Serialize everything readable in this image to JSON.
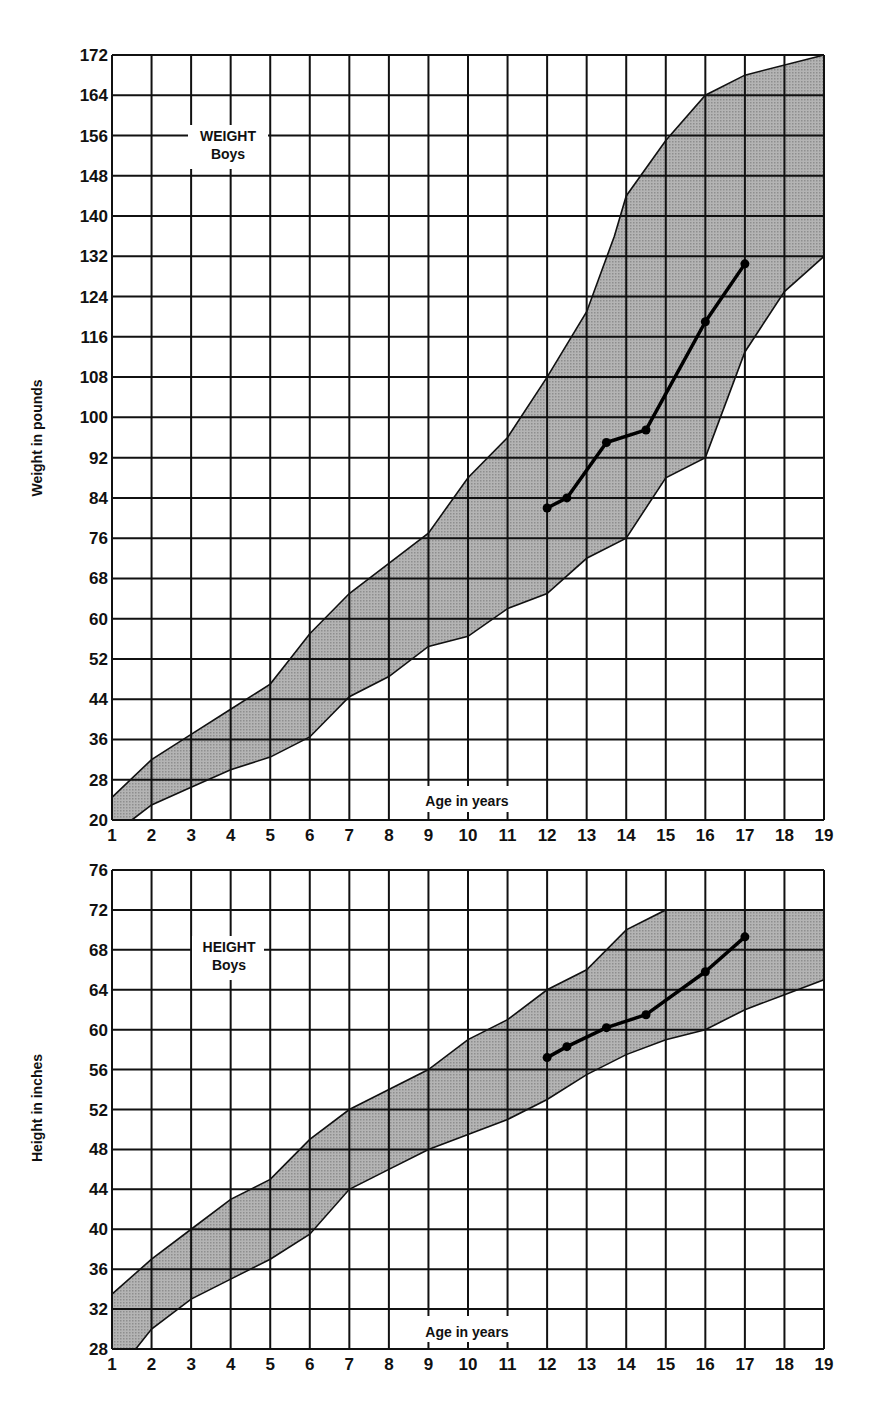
{
  "chart_data": [
    {
      "type": "area",
      "title": "WEIGHT",
      "subtitle": "Boys",
      "xlabel": "Age in years",
      "ylabel": "Weight in pounds",
      "xlim": [
        1,
        19
      ],
      "ylim": [
        20,
        172
      ],
      "grid": true,
      "x_ticks": [
        1,
        2,
        3,
        4,
        5,
        6,
        7,
        8,
        9,
        10,
        11,
        12,
        13,
        14,
        15,
        16,
        17,
        18,
        19
      ],
      "y_ticks": [
        20,
        28,
        36,
        44,
        52,
        60,
        68,
        76,
        84,
        92,
        100,
        108,
        116,
        124,
        132,
        140,
        148,
        156,
        164,
        172
      ],
      "series": [
        {
          "name": "Normal range upper bound",
          "x": [
            1,
            2,
            3,
            4,
            5,
            5.5,
            6,
            7,
            8,
            9,
            10,
            11,
            12,
            13,
            13.7,
            14,
            15,
            16,
            17,
            19
          ],
          "values": [
            24.5,
            32,
            37,
            42,
            47,
            52,
            57,
            65,
            71,
            77,
            88,
            96,
            108,
            121,
            136,
            144,
            155,
            164,
            168,
            172
          ]
        },
        {
          "name": "Normal range lower bound",
          "x": [
            1.5,
            2,
            3,
            4,
            5,
            6,
            7,
            8,
            9,
            10,
            11,
            12,
            13,
            14,
            15,
            16,
            17,
            18,
            19
          ],
          "values": [
            20,
            23,
            26.5,
            30,
            32.5,
            36.5,
            44.5,
            48.5,
            54.5,
            56.5,
            62,
            65,
            72,
            76,
            88,
            92,
            113,
            125,
            132
          ]
        },
        {
          "name": "Individual record",
          "x": [
            12,
            12.5,
            13.5,
            14.5,
            16,
            17
          ],
          "values": [
            82,
            84,
            95,
            97.5,
            119,
            130.5
          ]
        }
      ]
    },
    {
      "type": "area",
      "title": "HEIGHT",
      "subtitle": "Boys",
      "xlabel": "Age in years",
      "ylabel": "Height in inches",
      "xlim": [
        1,
        19
      ],
      "ylim": [
        28,
        76
      ],
      "grid": true,
      "x_ticks": [
        1,
        2,
        3,
        4,
        5,
        6,
        7,
        8,
        9,
        10,
        11,
        12,
        13,
        14,
        15,
        16,
        17,
        18,
        19
      ],
      "y_ticks": [
        28,
        32,
        36,
        40,
        44,
        48,
        52,
        56,
        60,
        64,
        68,
        72,
        76
      ],
      "series": [
        {
          "name": "Normal range upper bound",
          "x": [
            1,
            2,
            3,
            4,
            5,
            5.5,
            6,
            7,
            8,
            9,
            10,
            11,
            12,
            13,
            14,
            15,
            16,
            17,
            19
          ],
          "values": [
            33.5,
            37,
            40,
            43,
            45,
            47,
            49,
            52,
            54,
            56,
            59,
            61,
            64,
            66,
            70,
            72,
            72,
            72,
            72
          ]
        },
        {
          "name": "Normal range lower bound",
          "x": [
            1.6,
            2,
            3,
            4,
            5,
            6,
            7,
            8,
            9,
            10,
            11,
            12,
            13,
            14,
            15,
            16,
            17,
            18,
            19
          ],
          "values": [
            28,
            30,
            33,
            35,
            37,
            39.5,
            44,
            46,
            48,
            49.5,
            51,
            53,
            55.5,
            57.5,
            59,
            60,
            62,
            63.5,
            65
          ]
        },
        {
          "name": "Individual record",
          "x": [
            12,
            12.5,
            13.5,
            14.5,
            16,
            17
          ],
          "values": [
            57.2,
            58.3,
            60.2,
            61.5,
            65.8,
            69.3
          ]
        }
      ]
    }
  ],
  "weight_chart": {
    "title": "WEIGHT",
    "subtitle": "Boys",
    "xlabel": "Age in years",
    "ylabel": "Weight in pounds"
  },
  "height_chart": {
    "title": "HEIGHT",
    "subtitle": "Boys",
    "xlabel": "Age in years",
    "ylabel": "Height in inches"
  },
  "colors": {
    "band_fill": "#a9a9a9",
    "grid_line": "#111111",
    "record_line": "#000000",
    "background": "#ffffff"
  }
}
